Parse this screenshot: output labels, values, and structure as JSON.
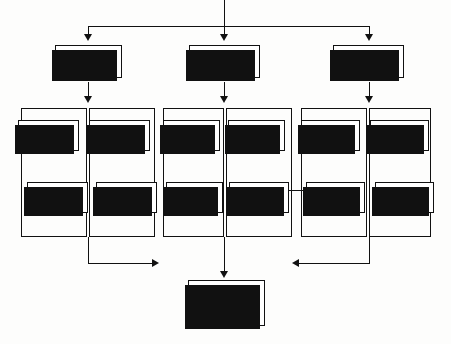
{
  "diagram": {
    "background_color": "#fdfdfc",
    "line_color": "#111111",
    "box_fill": "#ffffff",
    "shadow_color": "#111111"
  },
  "tier1": [
    {
      "id": "resource-inputs",
      "label": "Resource\nInputs"
    },
    {
      "id": "operational-control",
      "label": "Operational\nControl"
    },
    {
      "id": "inspection-procedures",
      "label": "Inspection\nProcedures"
    }
  ],
  "columns": [
    {
      "id": "services-consultant-column",
      "parent": "resource-inputs",
      "items": [
        {
          "id": "services-consultant",
          "label": "Services\nConsultant"
        },
        {
          "id": "sub-contracts",
          "label": "Sub-\nContracts"
        }
      ]
    },
    {
      "id": "materials-column",
      "parent": "resource-inputs",
      "items": [
        {
          "id": "materials",
          "label": "Materials"
        },
        {
          "id": "in-house-resources",
          "label": "In-house\nresources"
        }
      ]
    },
    {
      "id": "tasks-column",
      "parent": "operational-control",
      "items": [
        {
          "id": "tasks",
          "label": "Tasks"
        },
        {
          "id": "standards",
          "label": "Standards"
        }
      ]
    },
    {
      "id": "special-tasks-column",
      "parent": "operational-control",
      "items": [
        {
          "id": "special-tasks",
          "label": "Special\nTasks"
        },
        {
          "id": "performance-criteria",
          "label": "Performance\nCriteria"
        }
      ]
    },
    {
      "id": "products-column",
      "parent": "inspection-procedures",
      "items": [
        {
          "id": "products",
          "label": "Products"
        },
        {
          "id": "processes",
          "label": "Processes"
        }
      ]
    },
    {
      "id": "inspection-tasks-column",
      "parent": "inspection-procedures",
      "items": [
        {
          "id": "inspection-tasks",
          "label": "Tasks"
        },
        {
          "id": "equipment",
          "label": "Equipment"
        }
      ]
    }
  ],
  "bottom": {
    "id": "environmental-system-records",
    "label": "Environmental\nSystem\nRecords"
  },
  "connectors": {
    "top_feed": "single input splits into three branches",
    "left_return": "left group feeds right into records",
    "right_return": "right group feeds left into records",
    "center_drop": "centre group drops directly into records"
  }
}
